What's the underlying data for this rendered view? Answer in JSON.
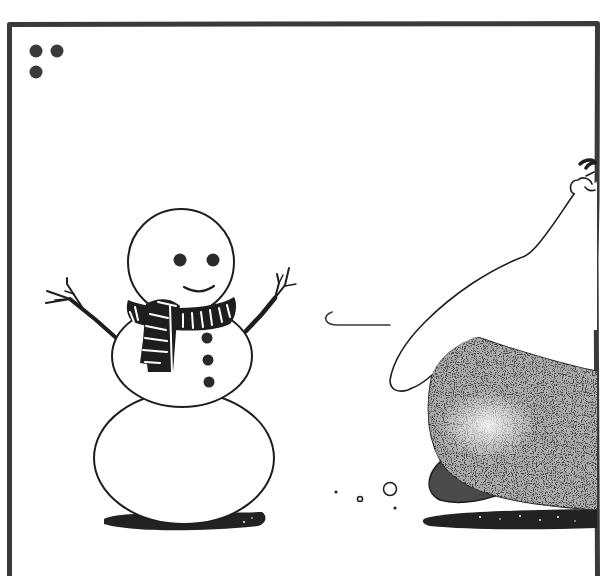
{
  "comic_panel": {
    "description": "Single comic panel: a smiling snowman with a striped scarf and stick arms faces a large pale figure whose hand dips toward a dark speckled mound; a small motion line and snow puffs between them",
    "panel_number_dots": 3,
    "colors": {
      "background": "#ffffff",
      "ink": "#1e1e1e",
      "frame": "#3a3a3a",
      "dark_mound": "#4a4a4a",
      "shadow": "#222222"
    },
    "snowman": {
      "eyes": 2,
      "buttons": 3,
      "scarf": "striped black and white",
      "arms": "twigs"
    },
    "figure": {
      "body": "dark speckled mound",
      "arm": "large pale arm reaching down"
    }
  }
}
